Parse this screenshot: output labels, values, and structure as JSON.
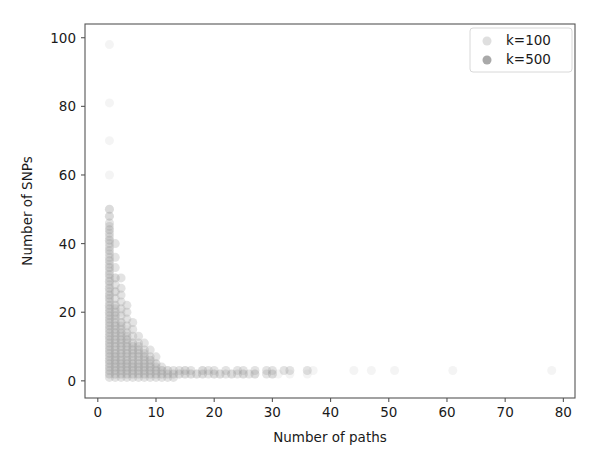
{
  "chart_data": {
    "type": "scatter",
    "title": "",
    "xlabel": "Number of paths",
    "ylabel": "Number of SNPs",
    "xlim": [
      -2.2,
      82
    ],
    "ylim": [
      -5,
      104
    ],
    "xticks": [
      0,
      10,
      20,
      30,
      40,
      50,
      60,
      70,
      80
    ],
    "yticks": [
      0,
      20,
      40,
      60,
      80,
      100
    ],
    "xtick_labels": [
      "0",
      "10",
      "20",
      "30",
      "40",
      "50",
      "60",
      "70",
      "80"
    ],
    "ytick_labels": [
      "0",
      "20",
      "40",
      "60",
      "80",
      "100"
    ],
    "grid": false,
    "legend_position": "upper right",
    "marker": "circle",
    "marker_size": 9,
    "marker_alpha": 0.28,
    "series": [
      {
        "name": "k=100",
        "color": "#d9d9d9",
        "points": [
          [
            2,
            98
          ],
          [
            2,
            81
          ],
          [
            2,
            70
          ],
          [
            2,
            60
          ],
          [
            2,
            50
          ],
          [
            2,
            48
          ],
          [
            2,
            44
          ],
          [
            2,
            41
          ],
          [
            2,
            38
          ],
          [
            2,
            35
          ],
          [
            2,
            33
          ],
          [
            2,
            31
          ],
          [
            2,
            29
          ],
          [
            2,
            27
          ],
          [
            2,
            25
          ],
          [
            2,
            24
          ],
          [
            2,
            22
          ],
          [
            2,
            21
          ],
          [
            2,
            20
          ],
          [
            2,
            19
          ],
          [
            2,
            18
          ],
          [
            2,
            17
          ],
          [
            2,
            16
          ],
          [
            2,
            15
          ],
          [
            2,
            14
          ],
          [
            2,
            13
          ],
          [
            2,
            12
          ],
          [
            2,
            11
          ],
          [
            2,
            10
          ],
          [
            2,
            9
          ],
          [
            2,
            8
          ],
          [
            2,
            7
          ],
          [
            2,
            6
          ],
          [
            2,
            5
          ],
          [
            2,
            4
          ],
          [
            2,
            3
          ],
          [
            2,
            2
          ],
          [
            3,
            30
          ],
          [
            3,
            26
          ],
          [
            3,
            22
          ],
          [
            3,
            19
          ],
          [
            3,
            16
          ],
          [
            3,
            14
          ],
          [
            3,
            12
          ],
          [
            3,
            10
          ],
          [
            3,
            8
          ],
          [
            3,
            7
          ],
          [
            3,
            6
          ],
          [
            3,
            5
          ],
          [
            3,
            4
          ],
          [
            3,
            3
          ],
          [
            3,
            2
          ],
          [
            4,
            20
          ],
          [
            4,
            17
          ],
          [
            4,
            14
          ],
          [
            4,
            12
          ],
          [
            4,
            10
          ],
          [
            4,
            8
          ],
          [
            4,
            6
          ],
          [
            4,
            5
          ],
          [
            4,
            4
          ],
          [
            4,
            3
          ],
          [
            4,
            2
          ],
          [
            5,
            15
          ],
          [
            5,
            12
          ],
          [
            5,
            10
          ],
          [
            5,
            8
          ],
          [
            5,
            6
          ],
          [
            5,
            5
          ],
          [
            5,
            4
          ],
          [
            5,
            3
          ],
          [
            5,
            2
          ],
          [
            6,
            11
          ],
          [
            6,
            9
          ],
          [
            6,
            7
          ],
          [
            6,
            5
          ],
          [
            6,
            4
          ],
          [
            6,
            3
          ],
          [
            6,
            2
          ],
          [
            7,
            9
          ],
          [
            7,
            7
          ],
          [
            7,
            5
          ],
          [
            7,
            4
          ],
          [
            7,
            3
          ],
          [
            7,
            2
          ],
          [
            8,
            7
          ],
          [
            8,
            5
          ],
          [
            8,
            4
          ],
          [
            8,
            3
          ],
          [
            8,
            2
          ],
          [
            9,
            6
          ],
          [
            9,
            4
          ],
          [
            9,
            3
          ],
          [
            9,
            2
          ],
          [
            10,
            5
          ],
          [
            10,
            3
          ],
          [
            10,
            2
          ],
          [
            11,
            3
          ],
          [
            11,
            2
          ],
          [
            12,
            3
          ],
          [
            12,
            2
          ],
          [
            13,
            2
          ],
          [
            14,
            2
          ],
          [
            15,
            3
          ],
          [
            15,
            2
          ],
          [
            16,
            2
          ],
          [
            17,
            2
          ],
          [
            18,
            3
          ],
          [
            18,
            2
          ],
          [
            20,
            2
          ],
          [
            21,
            2
          ],
          [
            23,
            2
          ],
          [
            25,
            2
          ],
          [
            27,
            2
          ],
          [
            30,
            2
          ],
          [
            31,
            2
          ],
          [
            33,
            2
          ],
          [
            36,
            2
          ],
          [
            37,
            3
          ],
          [
            44,
            3
          ],
          [
            47,
            3
          ],
          [
            51,
            3
          ],
          [
            61,
            3
          ],
          [
            78,
            3
          ]
        ]
      },
      {
        "name": "k=500",
        "color": "#9a9a9a",
        "points": [
          [
            2,
            50
          ],
          [
            2,
            48
          ],
          [
            2,
            46
          ],
          [
            2,
            45
          ],
          [
            2,
            44
          ],
          [
            2,
            43
          ],
          [
            2,
            42
          ],
          [
            2,
            41
          ],
          [
            2,
            40
          ],
          [
            2,
            39
          ],
          [
            2,
            38
          ],
          [
            2,
            37
          ],
          [
            2,
            36
          ],
          [
            2,
            35
          ],
          [
            2,
            34
          ],
          [
            2,
            33
          ],
          [
            2,
            32
          ],
          [
            2,
            31
          ],
          [
            2,
            30
          ],
          [
            2,
            29
          ],
          [
            2,
            28
          ],
          [
            2,
            27
          ],
          [
            2,
            26
          ],
          [
            2,
            25
          ],
          [
            2,
            24
          ],
          [
            2,
            23
          ],
          [
            2,
            22
          ],
          [
            2,
            21
          ],
          [
            2,
            20
          ],
          [
            2,
            19
          ],
          [
            2,
            18
          ],
          [
            2,
            17
          ],
          [
            2,
            16
          ],
          [
            2,
            15
          ],
          [
            2,
            14
          ],
          [
            2,
            13
          ],
          [
            2,
            12
          ],
          [
            2,
            11
          ],
          [
            2,
            10
          ],
          [
            2,
            9
          ],
          [
            2,
            8
          ],
          [
            2,
            7
          ],
          [
            2,
            6
          ],
          [
            2,
            5
          ],
          [
            2,
            4
          ],
          [
            2,
            3
          ],
          [
            2,
            2
          ],
          [
            2,
            1
          ],
          [
            3,
            40
          ],
          [
            3,
            36
          ],
          [
            3,
            33
          ],
          [
            3,
            30
          ],
          [
            3,
            28
          ],
          [
            3,
            26
          ],
          [
            3,
            24
          ],
          [
            3,
            22
          ],
          [
            3,
            21
          ],
          [
            3,
            20
          ],
          [
            3,
            19
          ],
          [
            3,
            18
          ],
          [
            3,
            17
          ],
          [
            3,
            16
          ],
          [
            3,
            15
          ],
          [
            3,
            14
          ],
          [
            3,
            13
          ],
          [
            3,
            12
          ],
          [
            3,
            11
          ],
          [
            3,
            10
          ],
          [
            3,
            9
          ],
          [
            3,
            8
          ],
          [
            3,
            7
          ],
          [
            3,
            6
          ],
          [
            3,
            5
          ],
          [
            3,
            4
          ],
          [
            3,
            3
          ],
          [
            3,
            2
          ],
          [
            3,
            1
          ],
          [
            4,
            30
          ],
          [
            4,
            27
          ],
          [
            4,
            25
          ],
          [
            4,
            23
          ],
          [
            4,
            21
          ],
          [
            4,
            19
          ],
          [
            4,
            17
          ],
          [
            4,
            16
          ],
          [
            4,
            15
          ],
          [
            4,
            14
          ],
          [
            4,
            13
          ],
          [
            4,
            12
          ],
          [
            4,
            11
          ],
          [
            4,
            10
          ],
          [
            4,
            9
          ],
          [
            4,
            8
          ],
          [
            4,
            7
          ],
          [
            4,
            6
          ],
          [
            4,
            5
          ],
          [
            4,
            4
          ],
          [
            4,
            3
          ],
          [
            4,
            2
          ],
          [
            4,
            1
          ],
          [
            5,
            22
          ],
          [
            5,
            20
          ],
          [
            5,
            18
          ],
          [
            5,
            16
          ],
          [
            5,
            14
          ],
          [
            5,
            13
          ],
          [
            5,
            12
          ],
          [
            5,
            11
          ],
          [
            5,
            10
          ],
          [
            5,
            9
          ],
          [
            5,
            8
          ],
          [
            5,
            7
          ],
          [
            5,
            6
          ],
          [
            5,
            5
          ],
          [
            5,
            4
          ],
          [
            5,
            3
          ],
          [
            5,
            2
          ],
          [
            5,
            1
          ],
          [
            6,
            17
          ],
          [
            6,
            15
          ],
          [
            6,
            13
          ],
          [
            6,
            11
          ],
          [
            6,
            10
          ],
          [
            6,
            9
          ],
          [
            6,
            8
          ],
          [
            6,
            7
          ],
          [
            6,
            6
          ],
          [
            6,
            5
          ],
          [
            6,
            4
          ],
          [
            6,
            3
          ],
          [
            6,
            2
          ],
          [
            6,
            1
          ],
          [
            7,
            13
          ],
          [
            7,
            11
          ],
          [
            7,
            10
          ],
          [
            7,
            9
          ],
          [
            7,
            8
          ],
          [
            7,
            7
          ],
          [
            7,
            6
          ],
          [
            7,
            5
          ],
          [
            7,
            4
          ],
          [
            7,
            3
          ],
          [
            7,
            2
          ],
          [
            7,
            1
          ],
          [
            8,
            11
          ],
          [
            8,
            9
          ],
          [
            8,
            8
          ],
          [
            8,
            7
          ],
          [
            8,
            6
          ],
          [
            8,
            5
          ],
          [
            8,
            4
          ],
          [
            8,
            3
          ],
          [
            8,
            2
          ],
          [
            8,
            1
          ],
          [
            9,
            9
          ],
          [
            9,
            7
          ],
          [
            9,
            6
          ],
          [
            9,
            5
          ],
          [
            9,
            4
          ],
          [
            9,
            3
          ],
          [
            9,
            2
          ],
          [
            9,
            1
          ],
          [
            10,
            7
          ],
          [
            10,
            5
          ],
          [
            10,
            4
          ],
          [
            10,
            3
          ],
          [
            10,
            2
          ],
          [
            10,
            1
          ],
          [
            11,
            4
          ],
          [
            11,
            3
          ],
          [
            11,
            2
          ],
          [
            11,
            1
          ],
          [
            12,
            3
          ],
          [
            12,
            2
          ],
          [
            12,
            1
          ],
          [
            13,
            3
          ],
          [
            13,
            2
          ],
          [
            13,
            1
          ],
          [
            14,
            3
          ],
          [
            14,
            2
          ],
          [
            15,
            3
          ],
          [
            15,
            2
          ],
          [
            16,
            3
          ],
          [
            16,
            2
          ],
          [
            17,
            2
          ],
          [
            18,
            3
          ],
          [
            18,
            2
          ],
          [
            19,
            3
          ],
          [
            19,
            2
          ],
          [
            20,
            3
          ],
          [
            20,
            2
          ],
          [
            21,
            2
          ],
          [
            22,
            3
          ],
          [
            22,
            2
          ],
          [
            23,
            2
          ],
          [
            24,
            3
          ],
          [
            24,
            2
          ],
          [
            25,
            3
          ],
          [
            25,
            2
          ],
          [
            26,
            2
          ],
          [
            27,
            3
          ],
          [
            27,
            2
          ],
          [
            29,
            3
          ],
          [
            29,
            2
          ],
          [
            30,
            3
          ],
          [
            30,
            2
          ],
          [
            32,
            3
          ],
          [
            33,
            3
          ],
          [
            36,
            3
          ]
        ]
      }
    ]
  },
  "legend": {
    "entries": [
      {
        "label": "k=100",
        "color": "#d9d9d9"
      },
      {
        "label": "k=500",
        "color": "#9a9a9a"
      }
    ]
  }
}
